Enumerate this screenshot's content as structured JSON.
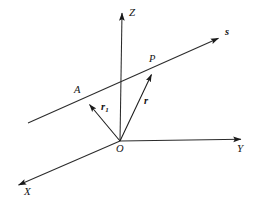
{
  "figure": {
    "background_color": "#ffffff",
    "line_color": "#2b2b2b",
    "label_color": "#141414",
    "width": 257,
    "height": 205
  },
  "axes": [
    {
      "id": "z",
      "label": "Z",
      "direction": "up",
      "origin": [
        120,
        141
      ],
      "tip": [
        122,
        9
      ]
    },
    {
      "id": "y",
      "label": "Y",
      "direction": "right",
      "origin": [
        120,
        141
      ],
      "tip": [
        245,
        139
      ]
    },
    {
      "id": "x",
      "label": "X",
      "direction": "lower-left",
      "origin": [
        120,
        141
      ],
      "tip": [
        14,
        187
      ]
    }
  ],
  "lines": [
    {
      "id": "s",
      "label": "s",
      "style": "bold-italic",
      "start": [
        28,
        123
      ],
      "tip": [
        223,
        36
      ],
      "description": "straight line s passing through points A and P"
    }
  ],
  "points": [
    {
      "id": "origin",
      "label": "O",
      "x": 120,
      "y": 141
    },
    {
      "id": "point-a",
      "label": "A",
      "x": 86,
      "y": 101
    },
    {
      "id": "point-p",
      "label": "P",
      "x": 154,
      "y": 70
    }
  ],
  "vectors": [
    {
      "id": "r1",
      "label": "r",
      "subscript": "1",
      "from": [
        120,
        141
      ],
      "to": [
        86,
        101
      ],
      "description": "position vector from origin O to point A"
    },
    {
      "id": "r",
      "label": "r",
      "subscript": "",
      "from": [
        120,
        141
      ],
      "to": [
        154,
        70
      ],
      "description": "position vector from origin O to point P"
    }
  ],
  "labels": {
    "axis_z": "Z",
    "axis_y": "Y",
    "axis_x": "X",
    "line_s": "s",
    "point_o": "O",
    "point_a": "A",
    "point_p": "P",
    "vector_r1": "r",
    "vector_r1_sub": "1",
    "vector_r": "r"
  }
}
